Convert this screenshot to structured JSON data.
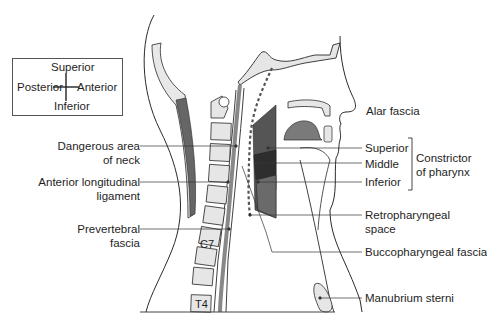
{
  "orientation": {
    "superior": "Superior",
    "posterior": "Posterior",
    "anterior": "Anterior",
    "inferior": "Inferior"
  },
  "labels_left": {
    "dangerous_area_line1": "Dangerous area",
    "dangerous_area_line2": "of neck",
    "anterior_longitudinal_line1": "Anterior longitudinal",
    "anterior_longitudinal_line2": "ligament",
    "prevertebral_line1": "Prevertebral",
    "prevertebral_line2": "fascia"
  },
  "labels_right": {
    "alar_fascia": "Alar fascia",
    "superior": "Superior",
    "middle": "Middle",
    "inferior": "Inferior",
    "constrictor_line1": "Constrictor",
    "constrictor_line2": "of pharynx",
    "retropharyngeal_line1": "Retropharyngeal",
    "retropharyngeal_line2": "space",
    "buccopharyngeal": "Buccopharyngeal fascia",
    "manubrium": "Manubrium sterni"
  },
  "vertebra_labels": {
    "c7": "C7",
    "t4": "T4"
  },
  "colors": {
    "outline": "#2a2a2a",
    "bone_fill": "#e6e6e6",
    "muscle_dark": "#3a3a3a",
    "muscle_mid": "#6a6a6a",
    "tongue": "#7a7a7a",
    "occipital_dark": "#666666"
  }
}
